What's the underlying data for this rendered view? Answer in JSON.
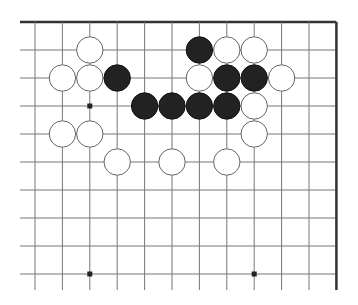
{
  "board": {
    "description": "Go board corner diagram (top-right region)",
    "columns": 12,
    "rows": 10,
    "origin_x": 35,
    "origin_y": 22,
    "spacing_x": 27.4,
    "spacing_y": 28,
    "left_extent_x": 20,
    "bottom_extent_y": 290,
    "edges": [
      "top",
      "right"
    ],
    "colors": {
      "line": "#777777",
      "edge": "#333333",
      "black_stone": "#222222",
      "white_stone": "#ffffff"
    }
  },
  "hoshi": [
    {
      "col": 2,
      "row": 3
    },
    {
      "col": 2,
      "row": 9
    },
    {
      "col": 8,
      "row": 9
    }
  ],
  "stones": [
    {
      "color": "white",
      "col": 2,
      "row": 1
    },
    {
      "color": "black",
      "col": 6,
      "row": 1
    },
    {
      "color": "white",
      "col": 7,
      "row": 1
    },
    {
      "color": "white",
      "col": 8,
      "row": 1
    },
    {
      "color": "white",
      "col": 1,
      "row": 2
    },
    {
      "color": "white",
      "col": 2,
      "row": 2
    },
    {
      "color": "black",
      "col": 3,
      "row": 2
    },
    {
      "color": "white",
      "col": 6,
      "row": 2
    },
    {
      "color": "black",
      "col": 7,
      "row": 2
    },
    {
      "color": "black",
      "col": 8,
      "row": 2
    },
    {
      "color": "white",
      "col": 9,
      "row": 2
    },
    {
      "color": "black",
      "col": 4,
      "row": 3
    },
    {
      "color": "black",
      "col": 5,
      "row": 3
    },
    {
      "color": "black",
      "col": 6,
      "row": 3
    },
    {
      "color": "black",
      "col": 7,
      "row": 3
    },
    {
      "color": "white",
      "col": 8,
      "row": 3
    },
    {
      "color": "white",
      "col": 1,
      "row": 4
    },
    {
      "color": "white",
      "col": 2,
      "row": 4
    },
    {
      "color": "white",
      "col": 8,
      "row": 4
    },
    {
      "color": "white",
      "col": 3,
      "row": 5
    },
    {
      "color": "white",
      "col": 5,
      "row": 5
    },
    {
      "color": "white",
      "col": 7,
      "row": 5
    }
  ]
}
